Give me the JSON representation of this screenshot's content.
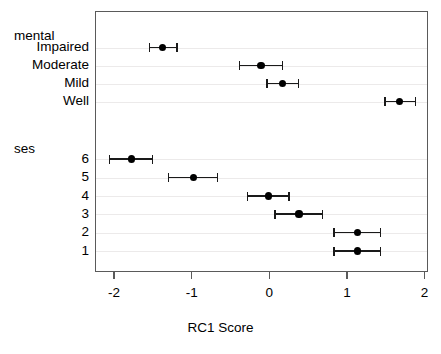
{
  "chart_data": {
    "type": "scatter",
    "title": "",
    "xlabel": "RC1 Score",
    "ylabel": "",
    "xlim": [
      -2.32,
      2.05
    ],
    "ylim": [
      0,
      11
    ],
    "grid": true,
    "legend": false,
    "xticks": [
      "-2",
      "-1",
      "0",
      "1",
      "2"
    ],
    "xtick_values": [
      -2,
      -1,
      0,
      1,
      2
    ],
    "groups": [
      {
        "name": "mental",
        "label": "mental",
        "categories": [
          "Impaired",
          "Moderate",
          "Mild",
          "Well"
        ],
        "values": [
          -1.39,
          -0.12,
          0.16,
          1.67
        ],
        "ci_low": [
          -1.56,
          -0.4,
          -0.04,
          1.48
        ],
        "ci_high": [
          -1.2,
          0.16,
          0.36,
          1.87
        ]
      },
      {
        "name": "ses",
        "label": "ses",
        "categories": [
          "6",
          "5",
          "4",
          "3",
          "2",
          "1"
        ],
        "values": [
          -1.79,
          -0.99,
          -0.02,
          0.37,
          1.12,
          1.12
        ],
        "ci_low": [
          -2.07,
          -1.31,
          -0.29,
          0.06,
          0.82,
          0.82
        ],
        "ci_high": [
          -1.52,
          -0.68,
          0.24,
          0.67,
          1.42,
          1.42
        ]
      }
    ],
    "marker_color": "#000000",
    "interval_color": "#1a1a1a",
    "frame_color": "#5a5a5a",
    "grid_color": "#eceaea",
    "background_color": "#ffffff"
  }
}
